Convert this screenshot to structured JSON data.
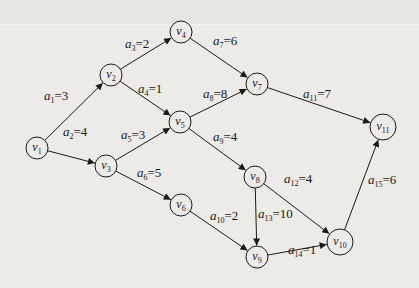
{
  "diagram": {
    "type": "AOE network (directed weighted graph)",
    "nodes": [
      {
        "id": "v1",
        "label": "v",
        "sub": "1",
        "x": 37,
        "y": 148,
        "r": 11
      },
      {
        "id": "v2",
        "label": "v",
        "sub": "2",
        "x": 111,
        "y": 75,
        "r": 11
      },
      {
        "id": "v3",
        "label": "v",
        "sub": "3",
        "x": 106,
        "y": 166,
        "r": 11
      },
      {
        "id": "v4",
        "label": "v",
        "sub": "4",
        "x": 181,
        "y": 32,
        "r": 11
      },
      {
        "id": "v5",
        "label": "v",
        "sub": "5",
        "x": 180,
        "y": 122,
        "r": 11
      },
      {
        "id": "v6",
        "label": "v",
        "sub": "6",
        "x": 181,
        "y": 205,
        "r": 11
      },
      {
        "id": "v7",
        "label": "v",
        "sub": "7",
        "x": 257,
        "y": 84,
        "r": 11
      },
      {
        "id": "v8",
        "label": "v",
        "sub": "8",
        "x": 255,
        "y": 177,
        "r": 11
      },
      {
        "id": "v9",
        "label": "v",
        "sub": "9",
        "x": 257,
        "y": 257,
        "r": 11
      },
      {
        "id": "v10",
        "label": "v",
        "sub": "10",
        "x": 340,
        "y": 242,
        "r": 13
      },
      {
        "id": "v11",
        "label": "v",
        "sub": "11",
        "x": 383,
        "y": 127,
        "r": 13
      }
    ],
    "edges": [
      {
        "id": "a1",
        "from": "v1",
        "to": "v2",
        "weight": 3,
        "sub": "1",
        "lx": 44,
        "ly": 100
      },
      {
        "id": "a2",
        "from": "v1",
        "to": "v3",
        "weight": 4,
        "sub": "2",
        "lx": 63,
        "ly": 136
      },
      {
        "id": "a3",
        "from": "v2",
        "to": "v4",
        "weight": 2,
        "sub": "3",
        "lx": 125,
        "ly": 48
      },
      {
        "id": "a4",
        "from": "v2",
        "to": "v5",
        "weight": 1,
        "sub": "4",
        "lx": 138,
        "ly": 93
      },
      {
        "id": "a5",
        "from": "v3",
        "to": "v5",
        "weight": 3,
        "sub": "5",
        "lx": 121,
        "ly": 139
      },
      {
        "id": "a6",
        "from": "v3",
        "to": "v6",
        "weight": 5,
        "sub": "6",
        "lx": 137,
        "ly": 177
      },
      {
        "id": "a7",
        "from": "v4",
        "to": "v7",
        "weight": 6,
        "sub": "7",
        "lx": 213,
        "ly": 45
      },
      {
        "id": "a8",
        "from": "v5",
        "to": "v7",
        "weight": 8,
        "sub": "8",
        "lx": 203,
        "ly": 98
      },
      {
        "id": "a9",
        "from": "v5",
        "to": "v8",
        "weight": 4,
        "sub": "9",
        "lx": 213,
        "ly": 141
      },
      {
        "id": "a10",
        "from": "v6",
        "to": "v9",
        "weight": 2,
        "sub": "10",
        "lx": 210,
        "ly": 220
      },
      {
        "id": "a11",
        "from": "v7",
        "to": "v11",
        "weight": 7,
        "sub": "11",
        "lx": 303,
        "ly": 98
      },
      {
        "id": "a12",
        "from": "v8",
        "to": "v10",
        "weight": 4,
        "sub": "12",
        "lx": 284,
        "ly": 183
      },
      {
        "id": "a13",
        "from": "v8",
        "to": "v9",
        "weight": 10,
        "sub": "13",
        "lx": 258,
        "ly": 218
      },
      {
        "id": "a14",
        "from": "v9",
        "to": "v10",
        "weight": 1,
        "sub": "14",
        "lx": 288,
        "ly": 254
      },
      {
        "id": "a15",
        "from": "v10",
        "to": "v11",
        "weight": 6,
        "sub": "15",
        "lx": 368,
        "ly": 184
      }
    ]
  },
  "colors": {
    "background": "#ecebe8",
    "stroke": "#1a1a1a"
  }
}
